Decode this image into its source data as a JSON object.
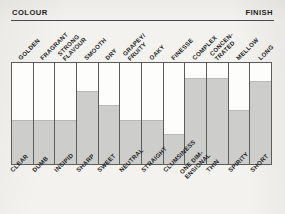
{
  "header": {
    "left_label": "COLOUR",
    "right_label": "FINISH"
  },
  "colors": {
    "paper": "#f3f1ee",
    "bar_fill": "#cdcdcb",
    "grid_line": "#5c5c5c",
    "text": "#1d1d1d"
  },
  "chart_data": {
    "type": "bar",
    "title": "",
    "subtitle": "",
    "xlabel": "",
    "ylabel": "",
    "ylim": [
      0,
      1
    ],
    "grid": false,
    "legend": "none",
    "orientation": "vertical",
    "axis_top_label": "COLOUR",
    "axis_top_label_right": "FINISH",
    "categories": [
      "CLEAR",
      "DUMB",
      "INSIPID",
      "SHARP",
      "SWEET",
      "NEUTRAL",
      "STRAIGHT",
      "CLUMSINESS",
      "ONE DIM-\nENSIONAL",
      "THIN",
      "SPIRITY",
      "SHORT"
    ],
    "categories_top": [
      "GOLDEN",
      "FRAGRANT",
      "STRONG\nFLAVOUR",
      "SMOOTH",
      "DRY",
      "GRAPEY/\nFRUITY",
      "OAKY",
      "FINESSE",
      "COMPLEX",
      "CONCEN-\nTRATED",
      "MELLOW",
      "LONG"
    ],
    "values": [
      0.44,
      0.44,
      0.44,
      0.72,
      0.58,
      0.44,
      0.44,
      0.3,
      0.85,
      0.85,
      0.53,
      0.82
    ]
  }
}
